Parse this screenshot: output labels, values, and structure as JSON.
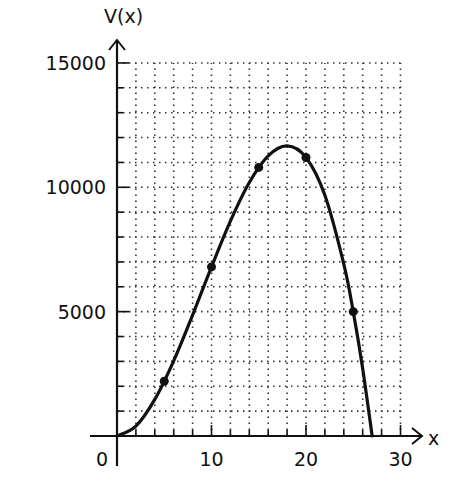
{
  "chart_data": {
    "type": "line",
    "title": "",
    "xlabel": "x",
    "ylabel": "V(x)",
    "xlim": [
      0,
      30
    ],
    "ylim": [
      0,
      15000
    ],
    "x_ticks": [
      0,
      10,
      20,
      30
    ],
    "y_ticks": [
      5000,
      10000,
      15000
    ],
    "x_tick_labels": [
      "0",
      "10",
      "20",
      "30"
    ],
    "y_tick_labels": [
      "5000",
      "10000",
      "15000"
    ],
    "grid": true,
    "grid_x_step": 2,
    "grid_y_step": 1000,
    "series": [
      {
        "name": "V(x)",
        "style": "smooth curve",
        "x": [
          0,
          2,
          4,
          6,
          8,
          10,
          12,
          14,
          16,
          18,
          20,
          22,
          24,
          25,
          26,
          27
        ],
        "values": [
          0,
          400,
          1472,
          3024,
          4864,
          6800,
          8640,
          10192,
          11264,
          11664,
          11200,
          9680,
          6912,
          5000,
          2704,
          0
        ]
      },
      {
        "name": "marked points",
        "style": "dots",
        "x": [
          5,
          10,
          15,
          20,
          25
        ],
        "values": [
          2200,
          6800,
          10800,
          11200,
          5000
        ]
      }
    ],
    "annotations": [
      "max near x = 18, V ≈ 11700"
    ]
  },
  "axes": {
    "x_label": "x",
    "y_label": "V(x)",
    "origin_label": "0"
  }
}
